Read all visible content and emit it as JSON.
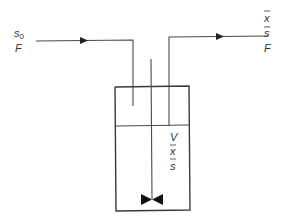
{
  "diagram": {
    "type": "chemostat stirred tank reactor",
    "colors": {
      "stroke": "#3a3a3a",
      "text": "#333333",
      "background": "#ffffff"
    },
    "inlet": {
      "labels": {
        "substrate": "s",
        "substrate_sub": "0",
        "flow": "F"
      }
    },
    "outlet": {
      "labels": {
        "biomass": "x",
        "substrate": "s",
        "flow": "F"
      }
    },
    "vessel": {
      "labels": {
        "volume": "V",
        "biomass": "x",
        "substrate": "s"
      }
    }
  }
}
